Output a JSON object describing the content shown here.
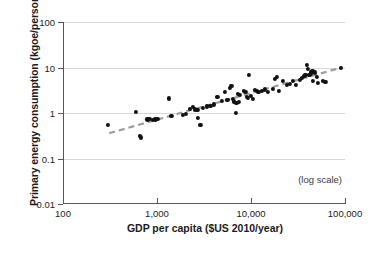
{
  "chart_data": {
    "type": "scatter",
    "title": "",
    "xlabel": "GDP per capita ($US 2010/year)",
    "ylabel": "Primary energy consumption (kgoe/person)",
    "annotation": "(log scale)",
    "xscale": "log",
    "yscale": "log",
    "xlim": [
      100,
      100000
    ],
    "ylim": [
      0.01,
      100
    ],
    "grid": true,
    "legend": "none",
    "xticks": [
      "100",
      "1,000",
      "10,000",
      "100,000"
    ],
    "xtick_values": [
      100,
      1000,
      10000,
      100000
    ],
    "yticks": [
      "100",
      "10",
      "1",
      "0.1",
      "0.01"
    ],
    "ytick_values": [
      100,
      10,
      1,
      0.1,
      0.01
    ],
    "trendline": {
      "style": "dashed",
      "color": "#9a9da0",
      "x_start": 310,
      "y_start": 0.36,
      "x_end": 95000,
      "y_end": 10.2
    },
    "point_color": "#111111",
    "points": [
      [
        300,
        0.55
      ],
      [
        600,
        1.05
      ],
      [
        660,
        0.31
      ],
      [
        670,
        0.29
      ],
      [
        790,
        0.72
      ],
      [
        830,
        0.75
      ],
      [
        900,
        0.7
      ],
      [
        960,
        0.72
      ],
      [
        1020,
        0.73
      ],
      [
        1350,
        2.1
      ],
      [
        1420,
        0.85
      ],
      [
        1900,
        0.92
      ],
      [
        2050,
        0.95
      ],
      [
        2250,
        1.25
      ],
      [
        2400,
        1.35
      ],
      [
        2550,
        1.2
      ],
      [
        2650,
        1.15
      ],
      [
        2700,
        1.18
      ],
      [
        2750,
        0.78
      ],
      [
        2900,
        0.55
      ],
      [
        3100,
        1.3
      ],
      [
        3400,
        1.4
      ],
      [
        3700,
        1.45
      ],
      [
        4000,
        1.55
      ],
      [
        4400,
        2.3
      ],
      [
        4900,
        1.85
      ],
      [
        5300,
        2.9
      ],
      [
        5600,
        1.95
      ],
      [
        6000,
        3.5
      ],
      [
        6200,
        3.95
      ],
      [
        6400,
        2.0
      ],
      [
        6600,
        1.8
      ],
      [
        6900,
        1.02
      ],
      [
        7000,
        1.7
      ],
      [
        7200,
        2.6
      ],
      [
        7400,
        1.75
      ],
      [
        7600,
        2.45
      ],
      [
        8400,
        3.05
      ],
      [
        8700,
        2.95
      ],
      [
        9000,
        2.3
      ],
      [
        9200,
        2.15
      ],
      [
        9500,
        7.0
      ],
      [
        9900,
        2.4
      ],
      [
        10500,
        2.05
      ],
      [
        11000,
        3.2
      ],
      [
        11500,
        3.1
      ],
      [
        12000,
        2.85
      ],
      [
        13000,
        3.0
      ],
      [
        14000,
        3.3
      ],
      [
        15000,
        2.95
      ],
      [
        17000,
        3.4
      ],
      [
        18000,
        5.6
      ],
      [
        19000,
        6.2
      ],
      [
        20000,
        3.1
      ],
      [
        22000,
        5.0
      ],
      [
        24000,
        4.1
      ],
      [
        26000,
        4.3
      ],
      [
        28000,
        5.1
      ],
      [
        30000,
        4.2
      ],
      [
        33000,
        5.4
      ],
      [
        35000,
        6.0
      ],
      [
        37000,
        6.6
      ],
      [
        38000,
        6.9
      ],
      [
        39000,
        11.5
      ],
      [
        40000,
        9.4
      ],
      [
        41000,
        7.0
      ],
      [
        42000,
        6.8
      ],
      [
        43000,
        7.4
      ],
      [
        44000,
        8.0
      ],
      [
        45000,
        8.2
      ],
      [
        46000,
        5.0
      ],
      [
        48000,
        7.8
      ],
      [
        50000,
        6.3
      ],
      [
        52000,
        4.6
      ],
      [
        58000,
        5.1
      ],
      [
        62000,
        4.9
      ],
      [
        90000,
        10.0
      ]
    ]
  }
}
